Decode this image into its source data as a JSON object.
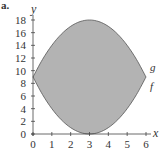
{
  "panel_label": "a.",
  "chart_data": {
    "type": "area",
    "title": "",
    "xlabel": "x",
    "ylabel": "y",
    "xlim": [
      0,
      6
    ],
    "ylim": [
      0,
      18
    ],
    "xticks": [
      0,
      1,
      2,
      3,
      4,
      5,
      6
    ],
    "yticks": [
      0,
      2,
      4,
      6,
      8,
      10,
      12,
      14,
      16,
      18
    ],
    "grid": false,
    "fill_color": "#b3b3b3",
    "series": [
      {
        "name": "g",
        "label_position": "right",
        "x": [
          0,
          0.5,
          1,
          1.5,
          2,
          2.5,
          3,
          3.5,
          4,
          4.5,
          5,
          5.5,
          6
        ],
        "values": [
          9,
          11.75,
          14,
          15.75,
          17,
          17.75,
          18,
          17.75,
          17,
          15.75,
          14,
          11.75,
          9
        ]
      },
      {
        "name": "f",
        "label_position": "right",
        "x": [
          0,
          0.5,
          1,
          1.5,
          2,
          2.5,
          3,
          3.5,
          4,
          4.5,
          5,
          5.5,
          6
        ],
        "values": [
          9,
          6.25,
          4,
          2.25,
          1,
          0.25,
          0,
          0.25,
          1,
          2.25,
          4,
          6.25,
          9
        ]
      }
    ],
    "shaded_region": "between g and f on [0, 6]"
  }
}
